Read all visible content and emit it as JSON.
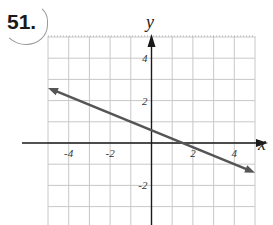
{
  "problem": {
    "number": "51."
  },
  "chart_data": {
    "type": "line",
    "title": "",
    "xlabel": "x",
    "ylabel": "y",
    "xlim": [
      -5,
      5
    ],
    "ylim": [
      -4,
      5
    ],
    "grid": true,
    "x_ticks": [
      {
        "value": -4,
        "label": "-4"
      },
      {
        "value": -2,
        "label": "-2"
      },
      {
        "value": 2,
        "label": "2"
      },
      {
        "value": 4,
        "label": "4"
      }
    ],
    "y_ticks": [
      {
        "value": 4,
        "label": "4"
      },
      {
        "value": 2,
        "label": "2"
      },
      {
        "value": -2,
        "label": "-2"
      }
    ],
    "series": [
      {
        "name": "line",
        "x": [
          -5,
          5
        ],
        "y": [
          2.6,
          -1.4
        ],
        "slope": -0.4,
        "y_intercept": 0.6,
        "x_intercept": 1.5,
        "arrows_both_ends": true,
        "color": "#555555"
      }
    ],
    "colors": {
      "grid": "#c8c8c8",
      "axes": "#1a1a1a",
      "line": "#555555"
    }
  }
}
